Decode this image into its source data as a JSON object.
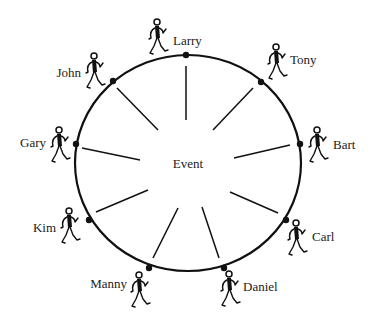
{
  "diagram": {
    "center_label": "Event",
    "ring": {
      "cx": 188,
      "cy": 163,
      "rx": 113,
      "ry": 108
    },
    "participants": [
      {
        "name": "Larry",
        "dot": [
          186,
          55
        ],
        "spoke": [
          [
            186,
            66
          ],
          [
            186,
            120
          ]
        ],
        "figure": [
          157,
          22
        ],
        "label_pos": [
          173,
          45
        ],
        "label_anchor": "start"
      },
      {
        "name": "Tony",
        "dot": [
          261,
          82
        ],
        "spoke": [
          [
            253,
            88
          ],
          [
            213,
            130
          ]
        ],
        "figure": [
          276,
          47
        ],
        "label_pos": [
          290,
          64
        ],
        "label_anchor": "start"
      },
      {
        "name": "Bart",
        "dot": [
          300,
          144
        ],
        "spoke": [
          [
            290,
            145
          ],
          [
            234,
            158
          ]
        ],
        "figure": [
          317,
          130
        ],
        "label_pos": [
          333,
          149
        ],
        "label_anchor": "start"
      },
      {
        "name": "Carl",
        "dot": [
          286,
          220
        ],
        "spoke": [
          [
            278,
            213
          ],
          [
            230,
            192
          ]
        ],
        "figure": [
          296,
          223
        ],
        "label_pos": [
          312,
          241
        ],
        "label_anchor": "start"
      },
      {
        "name": "Daniel",
        "dot": [
          224,
          268
        ],
        "spoke": [
          [
            219,
            258
          ],
          [
            202,
            207
          ]
        ],
        "figure": [
          229,
          274
        ],
        "label_pos": [
          243,
          291
        ],
        "label_anchor": "start"
      },
      {
        "name": "Manny",
        "dot": [
          149,
          268
        ],
        "spoke": [
          [
            153,
            258
          ],
          [
            178,
            208
          ]
        ],
        "figure": [
          139,
          275
        ],
        "label_pos": [
          127,
          288
        ],
        "label_anchor": "end"
      },
      {
        "name": "Kim",
        "dot": [
          89,
          220
        ],
        "spoke": [
          [
            96,
            212
          ],
          [
            148,
            190
          ]
        ],
        "figure": [
          69,
          211
        ],
        "label_pos": [
          56,
          232
        ],
        "label_anchor": "end"
      },
      {
        "name": "Gary",
        "dot": [
          76,
          144
        ],
        "spoke": [
          [
            82,
            148
          ],
          [
            140,
            160
          ]
        ],
        "figure": [
          59,
          130
        ],
        "label_pos": [
          46,
          147
        ],
        "label_anchor": "end"
      },
      {
        "name": "John",
        "dot": [
          113,
          81
        ],
        "spoke": [
          [
            117,
            88
          ],
          [
            158,
            130
          ]
        ],
        "figure": [
          94,
          56
        ],
        "label_pos": [
          81,
          77
        ],
        "label_anchor": "end"
      }
    ]
  }
}
